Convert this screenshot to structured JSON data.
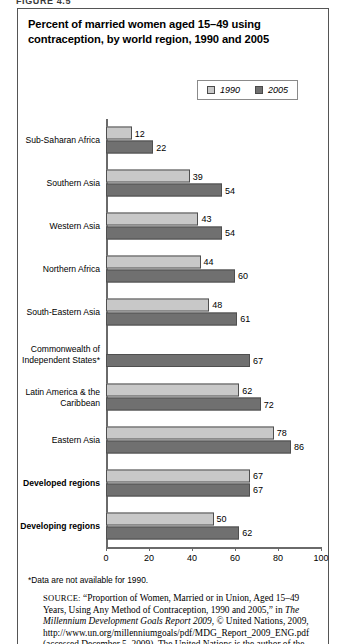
{
  "figure": {
    "label": "FIGURE 4.5",
    "title": "Percent of married women aged 15–49 using contraception, by world region, 1990 and 2005"
  },
  "legend": {
    "items": [
      {
        "label": "1990",
        "color": "#c8c8c8",
        "icon": "square-swatch-icon"
      },
      {
        "label": "2005",
        "color": "#707070",
        "icon": "square-swatch-icon"
      }
    ]
  },
  "footnote": "*Data are not available for 1990.",
  "source": {
    "prefix": "SOURCE:",
    "part1": " “Proportion of Women, Married or in Union, Aged 15–49 Years, Using Any Method of Contraception, 1990 and 2005,” in ",
    "italic1": "The Millennium Development Goals Report 2009",
    "part2": ", © United Nations, 2009, http://www.un.org/millenniumgoals/pdf/MDG_Report_2009_ENG.pdf (accessed December 5, 2009). The United Nations is the author of the"
  },
  "chart_data": {
    "type": "bar",
    "orientation": "horizontal",
    "title": "Percent of married women aged 15–49 using contraception, by world region, 1990 and 2005",
    "xlabel": "",
    "ylabel": "",
    "xlim": [
      0,
      100
    ],
    "xticks": [
      0,
      20,
      40,
      60,
      80,
      100
    ],
    "grid": false,
    "legend_position": "top-right",
    "categories": [
      "Sub-Saharan Africa",
      "Southern Asia",
      "Western Asia",
      "Northern Africa",
      "South-Eastern Asia",
      "Commonwealth of\nIndependent States*",
      "Latin America & the\nCaribbean",
      "Eastern Asia",
      "Developed regions",
      "Developing regions"
    ],
    "categories_bold": [
      false,
      false,
      false,
      false,
      false,
      false,
      false,
      false,
      true,
      true
    ],
    "series": [
      {
        "name": "1990",
        "color": "#c8c8c8",
        "values": [
          12,
          39,
          43,
          44,
          48,
          null,
          62,
          78,
          67,
          50
        ]
      },
      {
        "name": "2005",
        "color": "#707070",
        "values": [
          22,
          54,
          54,
          60,
          61,
          67,
          72,
          86,
          67,
          62
        ]
      }
    ]
  }
}
